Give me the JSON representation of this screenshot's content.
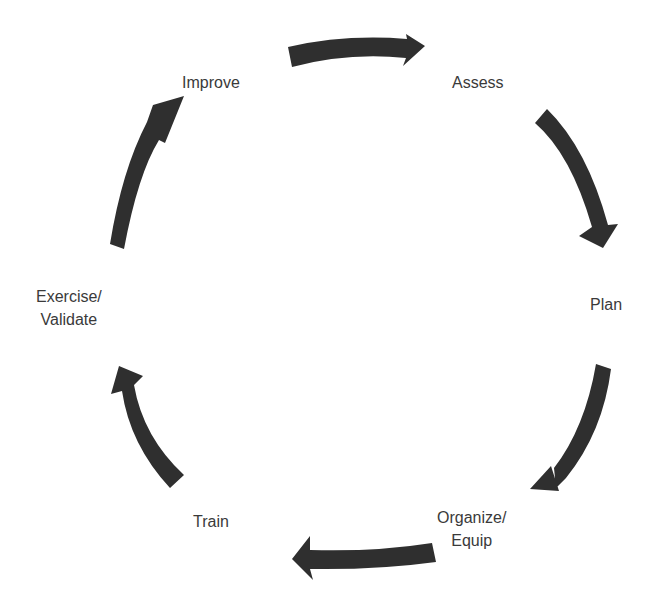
{
  "diagram": {
    "type": "cycle",
    "arrow_color": "#2f2f2f",
    "text_color": "#3a3a3a",
    "stages": [
      {
        "id": "assess",
        "lines": [
          "Assess"
        ]
      },
      {
        "id": "plan",
        "lines": [
          "Plan"
        ]
      },
      {
        "id": "organize-equip",
        "lines": [
          "Organize/",
          "Equip"
        ]
      },
      {
        "id": "train",
        "lines": [
          "Train"
        ]
      },
      {
        "id": "exercise-validate",
        "lines": [
          "Exercise/",
          "Validate"
        ]
      },
      {
        "id": "improve",
        "lines": [
          "Improve"
        ]
      }
    ],
    "flow": [
      {
        "from": "Improve",
        "to": "Assess"
      },
      {
        "from": "Assess",
        "to": "Plan"
      },
      {
        "from": "Plan",
        "to": "Organize/Equip"
      },
      {
        "from": "Organize/Equip",
        "to": "Train"
      },
      {
        "from": "Train",
        "to": "Exercise/Validate"
      },
      {
        "from": "Exercise/Validate",
        "to": "Improve"
      }
    ]
  }
}
